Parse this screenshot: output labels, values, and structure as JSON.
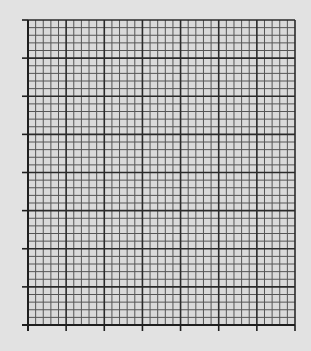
{
  "chart_data": {
    "type": "line",
    "title": "",
    "xlabel": "",
    "ylabel": "",
    "series": [],
    "x_major_divisions": 7,
    "y_major_divisions": 8,
    "minor_subdivisions": 5,
    "x_tick_labels": [],
    "y_tick_labels": [],
    "grid": true,
    "legend": null
  },
  "layout": {
    "plot_left": 28,
    "plot_top": 20,
    "plot_right": 295,
    "plot_bottom": 325,
    "tick_length": 6
  },
  "colors": {
    "background": "#e2e2e2",
    "plot_background": "#dadada",
    "major_line": "#2a2a2a",
    "minor_line": "#555555",
    "axis": "#1e1e1e"
  }
}
